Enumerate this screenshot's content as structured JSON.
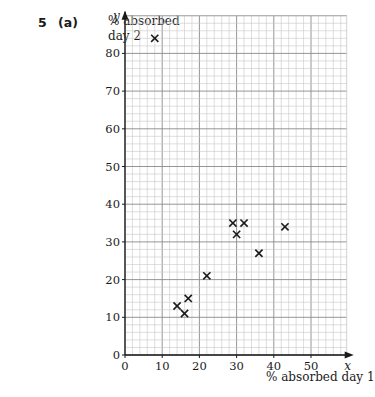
{
  "question": {
    "number": "5",
    "part": "(a)",
    "cutoff_text": "...the graph paper..."
  },
  "chart_data": {
    "type": "scatter",
    "title": "",
    "xlabel": "% absorbed day 1",
    "ylabel": "% absorbed day 2",
    "x_axis_letter": "x",
    "y_axis_letter": "y",
    "xlim": [
      0,
      59
    ],
    "ylim": [
      0,
      90
    ],
    "x_ticks": [
      0,
      10,
      20,
      30,
      40,
      50
    ],
    "y_ticks": [
      0,
      10,
      20,
      30,
      40,
      50,
      60,
      70,
      80
    ],
    "grid": true,
    "grid_minor_step": 2,
    "grid_major_step": 10,
    "marker": "x",
    "points": [
      {
        "x": 8,
        "y": 84
      },
      {
        "x": 14,
        "y": 13
      },
      {
        "x": 16,
        "y": 11
      },
      {
        "x": 17,
        "y": 15
      },
      {
        "x": 22,
        "y": 21
      },
      {
        "x": 29,
        "y": 35
      },
      {
        "x": 32,
        "y": 35
      },
      {
        "x": 30,
        "y": 32
      },
      {
        "x": 36,
        "y": 27
      },
      {
        "x": 43,
        "y": 34
      }
    ]
  },
  "labels": {
    "ylabel_line1": "% absorbed",
    "ylabel_line2": "day 2",
    "xlabel": "% absorbed day 1"
  }
}
